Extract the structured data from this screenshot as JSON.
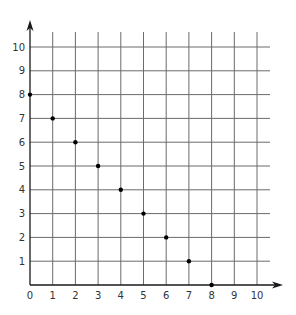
{
  "chart_data": {
    "type": "scatter",
    "title": "",
    "xlabel": "",
    "ylabel": "",
    "xlim": [
      0,
      10
    ],
    "ylim": [
      0,
      10
    ],
    "grid": true,
    "legend": null,
    "x_ticks": [
      0,
      1,
      2,
      3,
      4,
      5,
      6,
      7,
      8,
      9,
      10
    ],
    "y_ticks": [
      1,
      2,
      3,
      4,
      5,
      6,
      7,
      8,
      9,
      10
    ],
    "x_tick_labels": [
      "0",
      "1",
      "2",
      "3",
      "4",
      "5",
      "6",
      "7",
      "8",
      "9",
      "10"
    ],
    "y_tick_labels": [
      "1",
      "2",
      "3",
      "4",
      "5",
      "6",
      "7",
      "8",
      "9",
      "10"
    ],
    "series": [
      {
        "name": "points",
        "x": [
          0,
          1,
          2,
          3,
          4,
          5,
          6,
          7,
          8
        ],
        "y": [
          8,
          7,
          6,
          5,
          4,
          3,
          2,
          1,
          0
        ]
      }
    ],
    "colors": {
      "grid": "#6b6b6b",
      "axis": "#1a1a1a",
      "point": "#000000",
      "label": "#333333"
    }
  }
}
